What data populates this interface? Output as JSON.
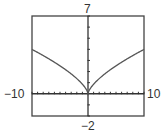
{
  "labels": {
    "ymax": "7",
    "ymin": "−2",
    "xmin": "−10",
    "xmax": "10"
  },
  "colors": {
    "frame": "#444444",
    "axis": "#333333",
    "curve": "#555555",
    "text": "#333333"
  },
  "chart_data": {
    "type": "line",
    "title": "",
    "xlabel": "",
    "ylabel": "",
    "xlim": [
      -10,
      10
    ],
    "ylim": [
      -2,
      7
    ],
    "xscale": 1,
    "yscale": 1,
    "grid": false,
    "legend": null,
    "tick_labels": {
      "xmin": "-10",
      "xmax": "10",
      "ymin": "-2",
      "ymax": "7"
    },
    "series": [
      {
        "name": "f(x)",
        "description": "cusp-shaped curve symmetric about the y-axis, minimum 0 at x=0, approximately y = 0.86*|x|^(2/3)",
        "x": [
          -10,
          -8,
          -6,
          -4,
          -3,
          -2,
          -1,
          -0.5,
          0,
          0.5,
          1,
          2,
          3,
          4,
          6,
          8,
          10
        ],
        "y": [
          4.0,
          3.45,
          2.85,
          2.17,
          1.79,
          1.37,
          0.86,
          0.54,
          0,
          0.54,
          0.86,
          1.37,
          1.79,
          2.17,
          2.85,
          3.45,
          4.0
        ]
      }
    ]
  }
}
